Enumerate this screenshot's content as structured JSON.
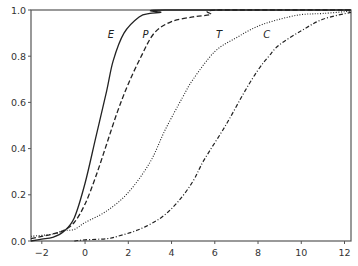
{
  "chart_data": {
    "type": "line",
    "title": "",
    "xlabel": "",
    "ylabel": "",
    "xlim": [
      -2.5,
      12.3
    ],
    "ylim": [
      0.0,
      1.0
    ],
    "grid": false,
    "legend": "inline labels near curves (italic letters)",
    "x_ticks": [
      -2,
      0,
      2,
      4,
      6,
      8,
      10,
      12
    ],
    "x_tick_labels": [
      "−2",
      "0",
      "2",
      "4",
      "6",
      "8",
      "10",
      "12"
    ],
    "y_ticks": [
      0.0,
      0.2,
      0.4,
      0.6,
      0.8,
      1.0
    ],
    "y_tick_labels": [
      "0.0",
      "0.2",
      "0.4",
      "0.6",
      "0.8",
      "1.0"
    ],
    "series": [
      {
        "name": "E",
        "style": "solid",
        "label_pos": [
          1.2,
          0.88
        ],
        "points": [
          [
            -2.5,
            0.0
          ],
          [
            -2.0,
            0.008
          ],
          [
            -1.5,
            0.016
          ],
          [
            -1.0,
            0.04
          ],
          [
            -0.5,
            0.1
          ],
          [
            0.0,
            0.25
          ],
          [
            0.5,
            0.45
          ],
          [
            1.0,
            0.65
          ],
          [
            1.3,
            0.78
          ],
          [
            1.8,
            0.9
          ],
          [
            2.5,
            0.97
          ],
          [
            3.0,
            0.985
          ],
          [
            3.5,
            0.99
          ],
          [
            3.7,
            1.0
          ],
          [
            12.3,
            1.0
          ]
        ]
      },
      {
        "name": "P",
        "style": "dashed",
        "label_pos": [
          2.8,
          0.88
        ],
        "points": [
          [
            -2.5,
            0.01
          ],
          [
            -2.0,
            0.02
          ],
          [
            -1.5,
            0.03
          ],
          [
            -1.0,
            0.045
          ],
          [
            -0.5,
            0.08
          ],
          [
            0.0,
            0.16
          ],
          [
            0.5,
            0.28
          ],
          [
            1.0,
            0.42
          ],
          [
            1.5,
            0.56
          ],
          [
            2.0,
            0.68
          ],
          [
            2.6,
            0.8
          ],
          [
            3.2,
            0.9
          ],
          [
            4.0,
            0.95
          ],
          [
            5.0,
            0.97
          ],
          [
            5.8,
            0.98
          ],
          [
            6.2,
            1.0
          ],
          [
            12.3,
            1.0
          ]
        ]
      },
      {
        "name": "T",
        "style": "dotted",
        "label_pos": [
          6.2,
          0.88
        ],
        "points": [
          [
            -2.5,
            0.02
          ],
          [
            -1.5,
            0.03
          ],
          [
            -1.0,
            0.045
          ],
          [
            -0.5,
            0.05
          ],
          [
            0.0,
            0.08
          ],
          [
            1.0,
            0.13
          ],
          [
            2.0,
            0.21
          ],
          [
            3.0,
            0.34
          ],
          [
            3.7,
            0.48
          ],
          [
            4.5,
            0.62
          ],
          [
            5.0,
            0.7
          ],
          [
            6.0,
            0.82
          ],
          [
            7.0,
            0.88
          ],
          [
            8.0,
            0.93
          ],
          [
            9.0,
            0.96
          ],
          [
            10.0,
            0.98
          ],
          [
            11.0,
            0.985
          ],
          [
            12.3,
            0.995
          ]
        ]
      },
      {
        "name": "C",
        "style": "dash-dot",
        "label_pos": [
          8.4,
          0.88
        ],
        "points": [
          [
            -0.5,
            0.0
          ],
          [
            0.0,
            0.005
          ],
          [
            1.0,
            0.01
          ],
          [
            1.5,
            0.02
          ],
          [
            2.5,
            0.05
          ],
          [
            3.5,
            0.1
          ],
          [
            4.3,
            0.17
          ],
          [
            5.0,
            0.26
          ],
          [
            5.5,
            0.35
          ],
          [
            6.5,
            0.5
          ],
          [
            7.4,
            0.65
          ],
          [
            8.0,
            0.74
          ],
          [
            8.5,
            0.8
          ],
          [
            9.0,
            0.85
          ],
          [
            10.0,
            0.91
          ],
          [
            11.0,
            0.96
          ],
          [
            12.3,
            0.99
          ]
        ]
      }
    ]
  },
  "colors": {
    "axis": "#555555",
    "line": "#222222",
    "tick_text": "#333333",
    "background": "#ffffff"
  }
}
